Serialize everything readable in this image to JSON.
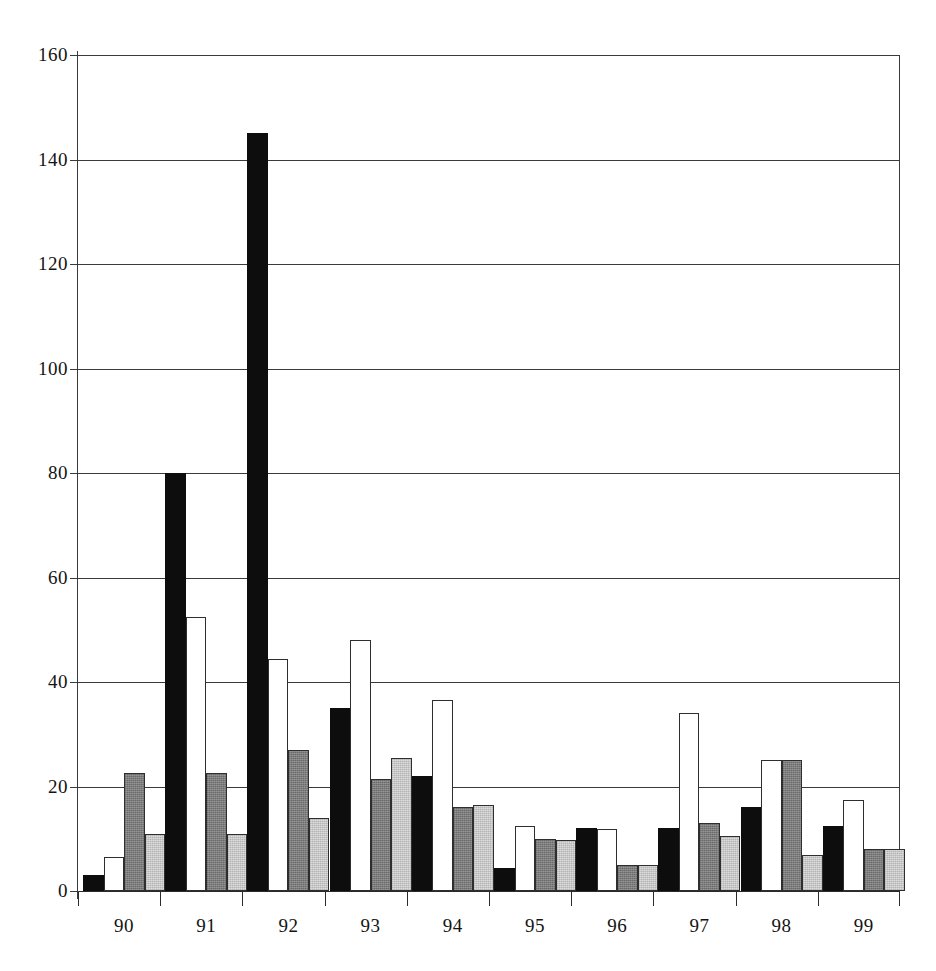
{
  "chart_data": {
    "type": "bar",
    "title": "",
    "subtitle": "",
    "xlabel": "",
    "ylabel": "",
    "categories": [
      "90",
      "91",
      "92",
      "93",
      "94",
      "95",
      "96",
      "97",
      "98",
      "99"
    ],
    "ylim": [
      0,
      160
    ],
    "ytick_values": [
      0,
      20,
      40,
      60,
      80,
      100,
      120,
      140,
      160
    ],
    "ytick_labels": [
      "0",
      "20",
      "40",
      "60",
      "80",
      "100",
      "120",
      "140",
      "160"
    ],
    "grid": true,
    "grid_axis": "y",
    "legend": false,
    "legend_position": "none",
    "bar_style": "grouped",
    "series": [
      {
        "name": "series-1",
        "fill": "black-solid",
        "color": "#0d0d0d",
        "values": [
          3,
          80,
          145,
          35,
          22,
          4.5,
          12,
          12,
          16,
          12.5
        ]
      },
      {
        "name": "series-2",
        "fill": "white-outlined",
        "color": "#ffffff",
        "values": [
          6.5,
          52.5,
          44.5,
          48,
          36.5,
          12.5,
          11.8,
          34,
          25,
          17.5
        ]
      },
      {
        "name": "series-3",
        "fill": "dark-gray-dither",
        "color": "#7c7c7c",
        "values": [
          22.5,
          22.5,
          27,
          21.5,
          16,
          10,
          5,
          13,
          25,
          8
        ]
      },
      {
        "name": "series-4",
        "fill": "light-gray-dither",
        "color": "#dcdcdc",
        "values": [
          11,
          11,
          14,
          25.5,
          16.5,
          9.8,
          5,
          10.5,
          6.8,
          8
        ]
      }
    ]
  }
}
